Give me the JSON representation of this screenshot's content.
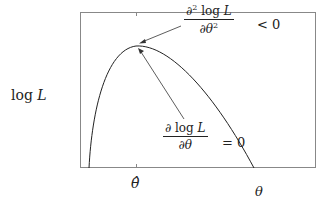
{
  "figure": {
    "type": "log-likelihood curve diagram",
    "y_axis_label": {
      "prefix": "log ",
      "var": "L"
    },
    "x_axis_label": "θ",
    "x_tick_label": "θ̂",
    "annotations": {
      "second_derivative": {
        "numerator_prefix": "∂",
        "numerator_sup": "2",
        "numerator_rest": " log ",
        "numerator_var": "L",
        "denominator": "∂θ",
        "denominator_sup": "2",
        "relation": "< 0"
      },
      "first_derivative": {
        "numerator": "∂ log ",
        "numerator_var": "L",
        "denominator": "∂θ",
        "relation": "= 0"
      }
    },
    "colors": {
      "line": "#222222",
      "frame": "#888888",
      "background": "#ffffff"
    }
  }
}
